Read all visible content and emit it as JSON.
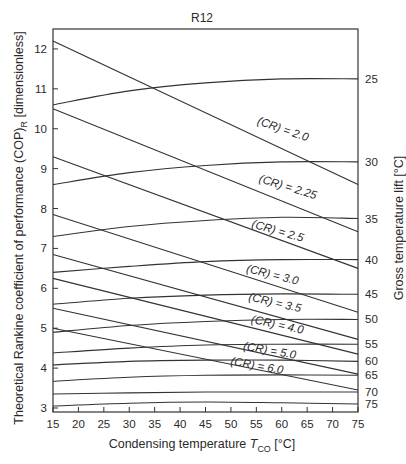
{
  "chart_data": {
    "type": "line",
    "title": "R12",
    "xlabel": "Condensing temperature T_CO [°C]",
    "xlabel_parts": {
      "pre": "Condensing temperature ",
      "var": "T",
      "sub": "CO",
      "post": " [°C]"
    },
    "ylabel": "Theoretical Rankine coefficient of performance (COP)_R [dimensionless]",
    "ylabel_parts": {
      "pre": "Theoretical Rankine coefficient of performance (COP)",
      "sub": "R",
      "post": " [dimensionless]"
    },
    "y2label": "Gross temperature lift [°C]",
    "xlim": [
      15,
      75
    ],
    "ylim": [
      2.9,
      12.5
    ],
    "xticks": [
      15,
      20,
      25,
      30,
      35,
      40,
      45,
      50,
      55,
      60,
      65,
      70,
      75
    ],
    "yticks": [
      3,
      4,
      5,
      6,
      7,
      8,
      9,
      10,
      11,
      12
    ],
    "grid": false,
    "legend": "inline labels",
    "lift_curves": [
      {
        "name": "25",
        "x": [
          15,
          30,
          45,
          60,
          75
        ],
        "y": [
          10.6,
          10.95,
          11.15,
          11.25,
          11.25
        ]
      },
      {
        "name": "30",
        "x": [
          15,
          30,
          45,
          60,
          75
        ],
        "y": [
          8.6,
          8.9,
          9.08,
          9.17,
          9.17
        ]
      },
      {
        "name": "35",
        "x": [
          15,
          30,
          45,
          60,
          75
        ],
        "y": [
          7.3,
          7.55,
          7.7,
          7.78,
          7.75
        ]
      },
      {
        "name": "40",
        "x": [
          15,
          30,
          45,
          60,
          75
        ],
        "y": [
          6.4,
          6.55,
          6.67,
          6.72,
          6.72
        ]
      },
      {
        "name": "45",
        "x": [
          15,
          30,
          45,
          60,
          75
        ],
        "y": [
          5.6,
          5.75,
          5.83,
          5.86,
          5.85
        ]
      },
      {
        "name": "50",
        "x": [
          15,
          30,
          45,
          60,
          75
        ],
        "y": [
          4.9,
          5.07,
          5.17,
          5.22,
          5.22
        ]
      },
      {
        "name": "55",
        "x": [
          15,
          30,
          45,
          60,
          75
        ],
        "y": [
          4.38,
          4.5,
          4.58,
          4.6,
          4.6
        ]
      },
      {
        "name": "60",
        "x": [
          15,
          30,
          45,
          60,
          75
        ],
        "y": [
          4.08,
          4.17,
          4.2,
          4.2,
          4.17
        ]
      },
      {
        "name": "65",
        "x": [
          15,
          30,
          45,
          60,
          75
        ],
        "y": [
          3.67,
          3.77,
          3.82,
          3.83,
          3.82
        ]
      },
      {
        "name": "70",
        "x": [
          15,
          30,
          45,
          60,
          75
        ],
        "y": [
          3.35,
          3.38,
          3.4,
          3.4,
          3.4
        ]
      },
      {
        "name": "75",
        "x": [
          15,
          30,
          45,
          60,
          75
        ],
        "y": [
          3.05,
          3.12,
          3.15,
          3.13,
          3.1
        ]
      }
    ],
    "cr_lines": [
      {
        "name": "(CR) = 2.0",
        "x": [
          15,
          75
        ],
        "y": [
          12.2,
          8.6
        ],
        "label_x": 60,
        "label_y": 9.9,
        "label_angle": 19
      },
      {
        "name": "(CR) = 2.25",
        "x": [
          15,
          75
        ],
        "y": [
          10.5,
          7.42
        ],
        "label_x": 61,
        "label_y": 8.45,
        "label_angle": 17
      },
      {
        "name": "(CR) = 2.5",
        "x": [
          15,
          75
        ],
        "y": [
          9.3,
          6.5
        ],
        "label_x": 59,
        "label_y": 7.35,
        "label_angle": 16
      },
      {
        "name": "(CR) = 3.0",
        "x": [
          15,
          75
        ],
        "y": [
          7.85,
          5.4
        ],
        "label_x": 58,
        "label_y": 6.25,
        "label_angle": 14
      },
      {
        "name": "(CR) = 3.5",
        "x": [
          15,
          75
        ],
        "y": [
          6.85,
          4.72
        ],
        "label_x": 58.5,
        "label_y": 5.55,
        "label_angle": 13
      },
      {
        "name": "(CR) = 4.0",
        "x": [
          15,
          75
        ],
        "y": [
          6.25,
          4.35
        ],
        "label_x": 59,
        "label_y": 5.0,
        "label_angle": 12
      },
      {
        "name": "(CR) = 5.0",
        "x": [
          15,
          75
        ],
        "y": [
          5.5,
          3.85
        ],
        "label_x": 57.5,
        "label_y": 4.35,
        "label_angle": 10
      },
      {
        "name": "(CR) = 6.0",
        "x": [
          15,
          75
        ],
        "y": [
          5.0,
          3.45
        ],
        "label_x": 55,
        "label_y": 3.97,
        "label_angle": 10
      }
    ],
    "right_axis_ticks": [
      "25",
      "30",
      "35",
      "40",
      "45",
      "50",
      "55",
      "60",
      "65",
      "70",
      "75"
    ]
  },
  "style": {
    "line_color": "#333333",
    "text_color": "#2a2a2a",
    "background": "#ffffff"
  },
  "layout": {
    "plot_left": 53,
    "plot_right": 358,
    "plot_top": 29,
    "plot_bottom": 412
  }
}
